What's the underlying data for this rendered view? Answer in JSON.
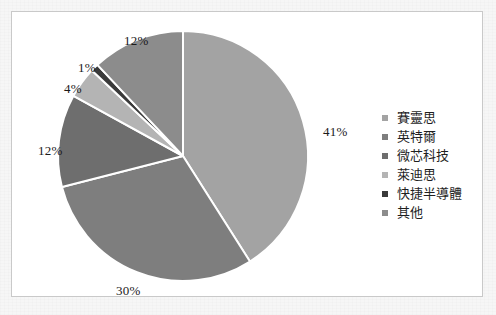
{
  "chart_data": {
    "type": "pie",
    "title": "",
    "categories": [
      "賽靈思",
      "英特爾",
      "微芯科技",
      "萊迪思",
      "快捷半導體",
      "其他"
    ],
    "values": [
      41,
      30,
      12,
      4,
      1,
      12
    ],
    "value_labels": [
      "41%",
      "30%",
      "12%",
      "4%",
      "1%",
      "12%"
    ],
    "unit": "%",
    "start_angle_deg": 0,
    "direction": "clockwise",
    "legend_position": "right",
    "grid": false,
    "colors": [
      "#a3a3a3",
      "#7e7e7e",
      "#6e6e6e",
      "#b4b4b4",
      "#3a3a3a",
      "#8c8c8c"
    ],
    "separator_color": "#ffffff",
    "slices": [
      {
        "label": "賽靈思",
        "value": 41,
        "value_label": "41%",
        "color": "#a3a3a3"
      },
      {
        "label": "英特爾",
        "value": 30,
        "value_label": "30%",
        "color": "#7e7e7e"
      },
      {
        "label": "微芯科技",
        "value": 12,
        "value_label": "12%",
        "color": "#6e6e6e"
      },
      {
        "label": "萊迪思",
        "value": 4,
        "value_label": "4%",
        "color": "#b4b4b4"
      },
      {
        "label": "快捷半導體",
        "value": 1,
        "value_label": "1%",
        "color": "#3a3a3a"
      },
      {
        "label": "其他",
        "value": 12,
        "value_label": "12%",
        "color": "#8c8c8c"
      }
    ],
    "label_positions": [
      {
        "value_label": "41%",
        "x": 311,
        "y": 112
      },
      {
        "value_label": "30%",
        "x": 104,
        "y": 271
      },
      {
        "value_label": "12%",
        "x": 26,
        "y": 131
      },
      {
        "value_label": "4%",
        "x": 52,
        "y": 69
      },
      {
        "value_label": "1%",
        "x": 66,
        "y": 48
      },
      {
        "value_label": "12%",
        "x": 112,
        "y": 21
      }
    ]
  },
  "legend": {
    "items": [
      {
        "label": "賽靈思",
        "color": "#a3a3a3"
      },
      {
        "label": "英特爾",
        "color": "#7e7e7e"
      },
      {
        "label": "微芯科技",
        "color": "#6e6e6e"
      },
      {
        "label": "萊迪思",
        "color": "#b4b4b4"
      },
      {
        "label": "快捷半導體",
        "color": "#3a3a3a"
      },
      {
        "label": "其他",
        "color": "#8c8c8c"
      }
    ]
  },
  "frame": {
    "border_color": "#c9c9c9",
    "background": "#ffffff",
    "page_background": "#f6f6f6"
  }
}
